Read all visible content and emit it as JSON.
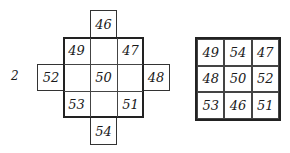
{
  "figure": {
    "label": "2",
    "left_diagram": {
      "top": "46",
      "inner": [
        [
          "49",
          "",
          "47"
        ],
        [
          "",
          "50",
          ""
        ],
        [
          "53",
          "",
          "51"
        ]
      ],
      "left": "52",
      "right": "48",
      "bottom": "54"
    },
    "right_square": [
      [
        "49",
        "54",
        "47"
      ],
      [
        "48",
        "50",
        "52"
      ],
      [
        "53",
        "46",
        "51"
      ]
    ]
  }
}
